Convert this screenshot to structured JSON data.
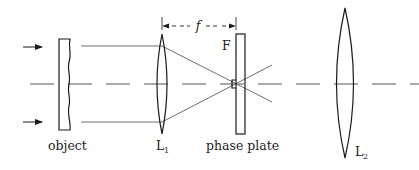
{
  "diagram": {
    "labels": {
      "object": "object",
      "lens1": "L",
      "lens1_sub": "1",
      "lens2": "L",
      "lens2_sub": "2",
      "phase_plate": "phase plate",
      "focal_point": "F",
      "focal_length": "f"
    },
    "components": [
      {
        "id": "object",
        "type": "wavy plate"
      },
      {
        "id": "L1",
        "type": "biconvex lens"
      },
      {
        "id": "phase_plate",
        "type": "plate with central step at focus F"
      },
      {
        "id": "L2",
        "type": "biconvex lens"
      }
    ],
    "annotations": {
      "focal_distance": "f, from L1 to phase plate (double-headed dashed arrow)",
      "incident_light": "two arrows pointing right onto object"
    },
    "colors": {
      "ink": "#1a1a1a",
      "ray": "#6e6e6e",
      "axis": "#555555"
    }
  }
}
